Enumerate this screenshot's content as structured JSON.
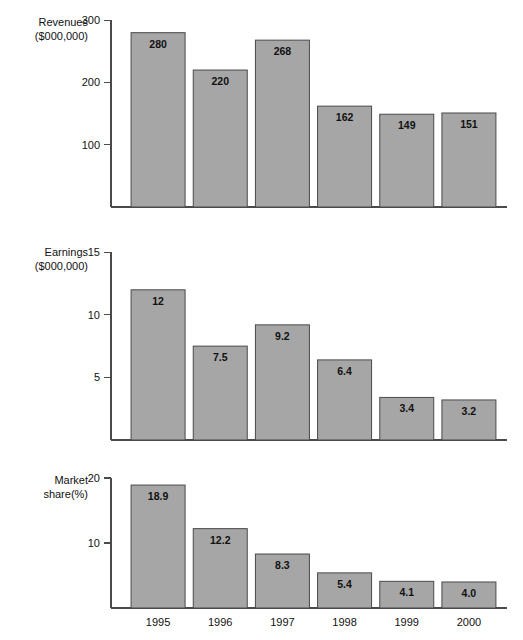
{
  "figure": {
    "width": 523,
    "height": 640,
    "background": "#ffffff",
    "bar_fill": "#a6a6a6",
    "bar_stroke": "#4a4a4a",
    "axis_color": "#4a4a4a"
  },
  "categories": [
    "1995",
    "1996",
    "1997",
    "1998",
    "1999",
    "2000"
  ],
  "chart_data": [
    {
      "type": "bar",
      "name": "revenues",
      "title": "",
      "ylabel": "Revenues\n($000,000)",
      "ylabel_line1": "Revenues",
      "ylabel_line2": "($000,000)",
      "xlabel": "",
      "categories": [
        "1995",
        "1996",
        "1997",
        "1998",
        "1999",
        "2000"
      ],
      "values": [
        280,
        220,
        268,
        162,
        149,
        151
      ],
      "value_labels": [
        "280",
        "220",
        "268",
        "162",
        "149",
        "151"
      ],
      "yticks": [
        100,
        200,
        300
      ],
      "ytick_labels": [
        "100",
        "200",
        "300"
      ],
      "ylim": [
        0,
        310
      ],
      "grid": false,
      "legend": "none"
    },
    {
      "type": "bar",
      "name": "earnings",
      "title": "",
      "ylabel": "Earnings\n($000,000)",
      "ylabel_line1": "Earnings",
      "ylabel_line2": "($000,000)",
      "xlabel": "",
      "categories": [
        "1995",
        "1996",
        "1997",
        "1998",
        "1999",
        "2000"
      ],
      "values": [
        12,
        7.5,
        9.2,
        6.4,
        3.4,
        3.2
      ],
      "value_labels": [
        "12",
        "7.5",
        "9.2",
        "6.4",
        "3.4",
        "3.2"
      ],
      "yticks": [
        5,
        10,
        15
      ],
      "ytick_labels": [
        "5",
        "10",
        "15"
      ],
      "ylim": [
        0,
        15.5
      ],
      "grid": false,
      "legend": "none"
    },
    {
      "type": "bar",
      "name": "market-share",
      "title": "",
      "ylabel": "Market\nshare(%)",
      "ylabel_line1": "Market",
      "ylabel_line2": "share(%)",
      "xlabel": "",
      "categories": [
        "1995",
        "1996",
        "1997",
        "1998",
        "1999",
        "2000"
      ],
      "values": [
        18.9,
        12.2,
        8.3,
        5.4,
        4.1,
        4.0
      ],
      "value_labels": [
        "18.9",
        "12.2",
        "8.3",
        "5.4",
        "4.1",
        "4.0"
      ],
      "yticks": [
        10,
        20
      ],
      "ytick_labels": [
        "10",
        "20"
      ],
      "ylim": [
        0,
        20.6
      ],
      "grid": false,
      "legend": "none"
    }
  ]
}
